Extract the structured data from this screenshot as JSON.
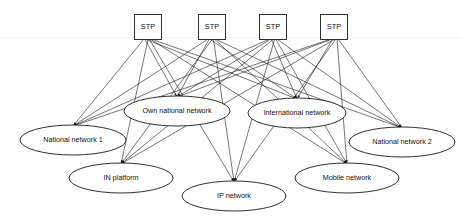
{
  "diagram": {
    "background_color": "#ffffff",
    "line_color": "#1a1a1a",
    "text_color": "#111111",
    "stp_nodes": [
      {
        "id": "stp1",
        "label": "STP",
        "shape": "rectangle",
        "cx": 148,
        "cy": 27,
        "w": 27,
        "h": 25
      },
      {
        "id": "stp2",
        "label": "STP",
        "shape": "rectangle",
        "cx": 212,
        "cy": 27,
        "w": 27,
        "h": 25
      },
      {
        "id": "stp3",
        "label": "STP",
        "shape": "rectangle",
        "cx": 273,
        "cy": 27,
        "w": 27,
        "h": 25
      },
      {
        "id": "stp4",
        "label": "STP",
        "shape": "rectangle",
        "cx": 334,
        "cy": 27,
        "w": 27,
        "h": 25
      }
    ],
    "network_nodes": [
      {
        "id": "own",
        "label": "Own national network",
        "shape": "ellipse",
        "cx": 177,
        "cy": 111,
        "rx": 53,
        "ry": 15,
        "anchor_x": 177,
        "anchor_y": 97
      },
      {
        "id": "intl",
        "label": "International network",
        "shape": "ellipse",
        "cx": 297,
        "cy": 113,
        "rx": 49,
        "ry": 15,
        "anchor_x": 297,
        "anchor_y": 99
      },
      {
        "id": "nat1",
        "label": "National network 1",
        "shape": "ellipse",
        "cx": 73,
        "cy": 140,
        "rx": 53,
        "ry": 15,
        "anchor_x": 73,
        "anchor_y": 126
      },
      {
        "id": "nat2",
        "label": "National network 2",
        "shape": "ellipse",
        "cx": 402,
        "cy": 142,
        "rx": 53,
        "ry": 15,
        "anchor_x": 402,
        "anchor_y": 128
      },
      {
        "id": "inplat",
        "label": "IN platform",
        "shape": "ellipse",
        "cx": 121,
        "cy": 178,
        "rx": 52,
        "ry": 15,
        "anchor_x": 121,
        "anchor_y": 164
      },
      {
        "id": "ip",
        "label": "IP network",
        "shape": "ellipse",
        "cx": 234,
        "cy": 196,
        "rx": 52,
        "ry": 15,
        "anchor_x": 234,
        "anchor_y": 182
      },
      {
        "id": "mobile",
        "label": "Mobile network",
        "shape": "ellipse",
        "cx": 347,
        "cy": 178,
        "rx": 52,
        "ry": 15,
        "anchor_x": 347,
        "anchor_y": 164
      }
    ],
    "links": [
      {
        "from": "stp1",
        "to": "nat1"
      },
      {
        "from": "stp1",
        "to": "own"
      },
      {
        "from": "stp1",
        "to": "intl"
      },
      {
        "from": "stp1",
        "to": "inplat"
      },
      {
        "from": "stp1",
        "to": "ip"
      },
      {
        "from": "stp1",
        "to": "mobile"
      },
      {
        "from": "stp1",
        "to": "nat2"
      },
      {
        "from": "stp2",
        "to": "nat1"
      },
      {
        "from": "stp2",
        "to": "own"
      },
      {
        "from": "stp2",
        "to": "intl"
      },
      {
        "from": "stp2",
        "to": "inplat"
      },
      {
        "from": "stp2",
        "to": "ip"
      },
      {
        "from": "stp2",
        "to": "mobile"
      },
      {
        "from": "stp2",
        "to": "nat2"
      },
      {
        "from": "stp3",
        "to": "nat1"
      },
      {
        "from": "stp3",
        "to": "own"
      },
      {
        "from": "stp3",
        "to": "intl"
      },
      {
        "from": "stp3",
        "to": "inplat"
      },
      {
        "from": "stp3",
        "to": "ip"
      },
      {
        "from": "stp3",
        "to": "mobile"
      },
      {
        "from": "stp3",
        "to": "nat2"
      },
      {
        "from": "stp4",
        "to": "nat1"
      },
      {
        "from": "stp4",
        "to": "own"
      },
      {
        "from": "stp4",
        "to": "intl"
      },
      {
        "from": "stp4",
        "to": "inplat"
      },
      {
        "from": "stp4",
        "to": "ip"
      },
      {
        "from": "stp4",
        "to": "mobile"
      },
      {
        "from": "stp4",
        "to": "nat2"
      }
    ]
  }
}
